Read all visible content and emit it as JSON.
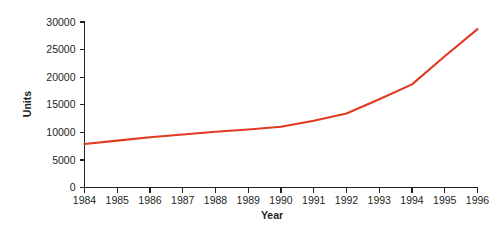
{
  "chart_data": {
    "type": "line",
    "title": "",
    "xlabel": "Year",
    "ylabel": "Units",
    "x": [
      1984,
      1985,
      1986,
      1987,
      1988,
      1989,
      1990,
      1991,
      1992,
      1993,
      1994,
      1995,
      1996
    ],
    "categories": [
      "1984",
      "1985",
      "1986",
      "1987",
      "1988",
      "1989",
      "1990",
      "1991",
      "1992",
      "1993",
      "1994",
      "1995",
      "1996"
    ],
    "values": [
      7900,
      8500,
      9100,
      9600,
      10100,
      10500,
      11000,
      12100,
      13400,
      16000,
      18700,
      23800,
      28700
    ],
    "series": [
      {
        "name": "Units",
        "color": "#e03a20",
        "values": [
          7900,
          8500,
          9100,
          9600,
          10100,
          10500,
          11000,
          12100,
          13400,
          16000,
          18700,
          23800,
          28700
        ]
      }
    ],
    "xlim": [
      1984,
      1996
    ],
    "ylim": [
      0,
      30000
    ],
    "ytick_labels": [
      "0",
      "5000",
      "10000",
      "15000",
      "20000",
      "25000",
      "30000"
    ],
    "ytick_values": [
      0,
      5000,
      10000,
      15000,
      20000,
      25000,
      30000
    ],
    "xtick_labels": [
      "1984",
      "1985",
      "1986",
      "1987",
      "1988",
      "1989",
      "1990",
      "1991",
      "1992",
      "1993",
      "1994",
      "1995",
      "1996"
    ],
    "grid": false,
    "legend": false,
    "legend_position": "none",
    "line_color": "#e03a20",
    "axis_color": "#231f20",
    "background_color": "#ffffff"
  }
}
